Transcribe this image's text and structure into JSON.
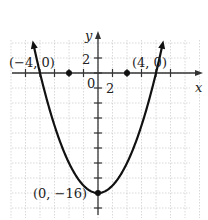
{
  "chart_data": {
    "type": "line",
    "title": "",
    "function": "y = x^2 - 16",
    "xlabel": "x",
    "ylabel": "y",
    "xlim": [
      -6,
      7
    ],
    "ylim": [
      -17,
      4
    ],
    "grid": true,
    "x_tick_step": 1,
    "y_tick_step": 2,
    "tick_labels": {
      "x": [
        "2"
      ],
      "y": [
        "2"
      ],
      "origin": "0"
    },
    "series": [
      {
        "name": "parabola",
        "x": [
          -4.4,
          -4,
          -3,
          -2,
          -1,
          0,
          1,
          2,
          3,
          4,
          4.4
        ],
        "y": [
          3.36,
          0,
          -7,
          -12,
          -15,
          -16,
          -15,
          -12,
          -7,
          0,
          3.36
        ]
      }
    ],
    "points": [
      {
        "label": "(−4, 0)",
        "x": -4,
        "y": 0
      },
      {
        "label": "(4, 0)",
        "x": 4,
        "y": 0
      },
      {
        "label": "(0, −16)",
        "x": 0,
        "y": -16
      }
    ]
  },
  "labels": {
    "x_axis": "x",
    "y_axis": "y",
    "origin": "0",
    "x_tick": "2",
    "y_tick": "2",
    "point_left": "(−4, 0)",
    "point_right": "(4, 0)",
    "vertex": "(0, −16)"
  }
}
